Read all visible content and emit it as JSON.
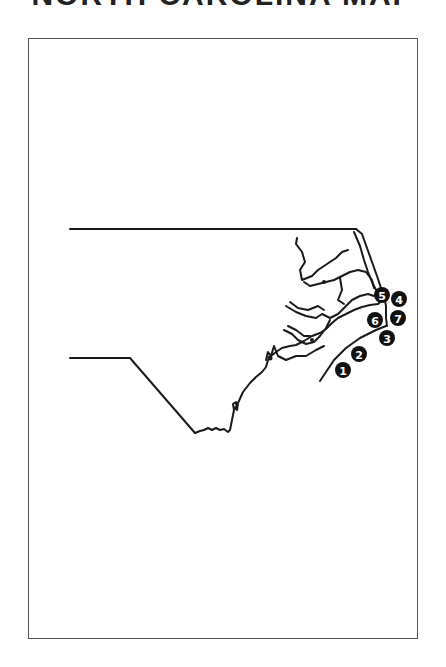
{
  "page": {
    "title_fragment": "NORTH CAROLINA MAP"
  },
  "map": {
    "region": "North Carolina",
    "stroke_color": "#1a1a1a",
    "badge_fill": "#111111",
    "badge_text_color": "#ffffff",
    "markers": [
      {
        "label": "1",
        "cx": 343,
        "cy": 370
      },
      {
        "label": "2",
        "cx": 359,
        "cy": 354
      },
      {
        "label": "3",
        "cx": 387,
        "cy": 338
      },
      {
        "label": "4",
        "cx": 399,
        "cy": 299
      },
      {
        "label": "5",
        "cx": 382,
        "cy": 295
      },
      {
        "label": "6",
        "cx": 375,
        "cy": 320
      },
      {
        "label": "7",
        "cx": 398,
        "cy": 318
      }
    ]
  }
}
